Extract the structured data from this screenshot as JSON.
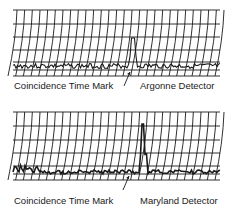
{
  "figure": {
    "panels": [
      {
        "id": "argonne",
        "mark_label": "Coincidence Time Mark",
        "detector_label": "Argonne Detector",
        "grid": {
          "x0": 13,
          "x1": 220,
          "top": 10,
          "hlines": [
            10,
            24,
            37,
            50,
            62,
            70,
            76
          ],
          "columns": 27
        },
        "baseline_y": 66,
        "spike": {
          "x": 133,
          "peak_y": 38
        }
      },
      {
        "id": "maryland",
        "mark_label": "Coincidence Time Mark",
        "detector_label": "Maryland Detector",
        "grid": {
          "x0": 13,
          "x1": 220,
          "top": 112,
          "hlines": [
            112,
            126,
            140,
            153,
            166,
            174,
            180
          ],
          "columns": 27
        },
        "baseline_y": 172,
        "spike": {
          "x": 143,
          "peak_y": 124
        }
      }
    ],
    "colors": {
      "ink": "#1a1a1a",
      "background": "#ffffff"
    }
  }
}
